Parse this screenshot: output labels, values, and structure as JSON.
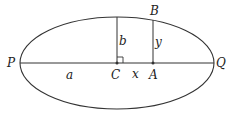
{
  "diagram": {
    "type": "ellipse-geometry",
    "colors": {
      "stroke": "#333333",
      "background": "#ffffff"
    },
    "labels": {
      "P": "P",
      "Q": "Q",
      "C": "C",
      "A": "A",
      "B": "B",
      "a": "a",
      "b": "b",
      "x": "x",
      "y": "y"
    },
    "elements": [
      "ellipse",
      "major-axis PQ",
      "semi-minor-axis segment from C (length b)",
      "right-angle marker at C",
      "vertical segment AB (length y)",
      "point C",
      "point A"
    ]
  }
}
